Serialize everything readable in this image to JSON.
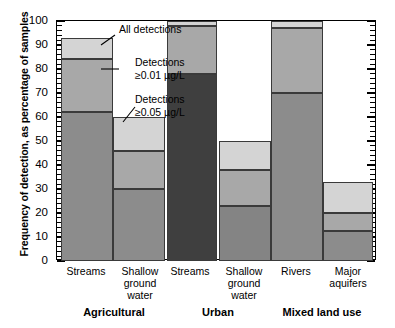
{
  "chart_data": {
    "type": "bar",
    "subtype": "stacked-overlap",
    "title": "",
    "xlabel": "",
    "ylabel": "Frequency of detection, as percentage of samples",
    "ylim": [
      0,
      100
    ],
    "ytick_labels": [
      "0",
      "10",
      "20",
      "30",
      "40",
      "50",
      "60",
      "70",
      "80",
      "90",
      "100"
    ],
    "ytick_values": [
      0,
      10,
      20,
      30,
      40,
      50,
      60,
      70,
      80,
      90,
      100
    ],
    "grid": false,
    "legend_position": "inline-annotations",
    "series": [
      {
        "name": "All detections",
        "values": [
          93,
          60,
          100,
          50,
          100,
          33
        ]
      },
      {
        "name": "Detections ≥0.01 µg/L",
        "values": [
          84,
          46,
          98,
          38,
          97,
          20
        ]
      },
      {
        "name": "Detections ≥0.05 µg/L",
        "values": [
          62,
          30,
          78,
          23,
          70,
          12.5
        ]
      }
    ],
    "categories": [
      "Streams",
      "Shallow\nground\nwater",
      "Streams",
      "Shallow\nground\nwater",
      "Rivers",
      "Major\naquifers"
    ],
    "groups": [
      {
        "label": "Agricultural",
        "categories": [
          "Streams",
          "Shallow\nground\nwater"
        ]
      },
      {
        "label": "Urban",
        "categories": [
          "Streams",
          "Shallow\nground\nwater"
        ]
      },
      {
        "label": "Mixed land use",
        "categories": [
          "Rivers",
          "Major\naquifers"
        ]
      }
    ],
    "annotations": [
      "All detections",
      "Detections\n≥0.01 µg/L",
      "Detections\n≥0.05 µg/L"
    ],
    "colors": {
      "all_detections": "#d4d4d4",
      "detections_001_default": "#a8a8a8",
      "detections_005_agricultural": "#8c8c8c",
      "detections_005_urban_streams": "#3f3f3f",
      "detections_005_urban_gw": "#848484",
      "detections_005_mixed": "#8c8c8c",
      "outline": "#3a3a3a",
      "background": "#ffffff",
      "text": "#000000"
    }
  },
  "axis": {
    "y_title": "Frequency of detection, as percentage of samples",
    "ticks": [
      {
        "label": "100",
        "value": 100
      },
      {
        "label": "90",
        "value": 90
      },
      {
        "label": "80",
        "value": 80
      },
      {
        "label": "70",
        "value": 70
      },
      {
        "label": "60",
        "value": 60
      },
      {
        "label": "50",
        "value": 50
      },
      {
        "label": "40",
        "value": 40
      },
      {
        "label": "30",
        "value": 30
      },
      {
        "label": "20",
        "value": 20
      },
      {
        "label": "10",
        "value": 10
      },
      {
        "label": "0",
        "value": 0
      }
    ]
  },
  "annotations": {
    "all_detections": "All detections",
    "detections_001": "Detections\n≥0.01 µg/L",
    "detections_005": "Detections\n≥0.05 µg/L"
  },
  "categories": {
    "c0": "Streams",
    "c1": "Shallow\nground\nwater",
    "c2": "Streams",
    "c3": "Shallow\nground\nwater",
    "c4": "Rivers",
    "c5": "Major\naquifers"
  },
  "groups": {
    "g0": "Agricultural",
    "g1": "Urban",
    "g2": "Mixed land use"
  }
}
